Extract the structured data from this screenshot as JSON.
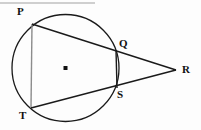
{
  "figure": {
    "background_color": "#fdfdfd",
    "stroke_color": "#1a1a1a",
    "chord_pt_color": "#8c8c8c",
    "header_rule_color": "#cfcfcf",
    "circle": {
      "center_x": 65.5,
      "center_y": 68,
      "radius": 53.5,
      "center_dot_label": "center-dot"
    },
    "header_rule": {
      "x1": 0,
      "y1": 3,
      "x2": 95,
      "y2": 3
    },
    "points": [
      {
        "id": "P",
        "label": "P",
        "x": 32,
        "y": 24,
        "label_x": 17,
        "label_y": 6,
        "on_circle": true
      },
      {
        "id": "Q",
        "label": "Q",
        "x": 116,
        "y": 50,
        "label_x": 119,
        "label_y": 38,
        "on_circle": true
      },
      {
        "id": "R",
        "label": "R",
        "x": 176,
        "y": 70,
        "label_x": 182,
        "label_y": 64,
        "on_circle": false
      },
      {
        "id": "S",
        "label": "S",
        "x": 117,
        "y": 88,
        "label_x": 117,
        "label_y": 89,
        "on_circle": true
      },
      {
        "id": "T",
        "label": "T",
        "x": 31,
        "y": 108,
        "label_x": 19,
        "label_y": 110,
        "on_circle": true
      }
    ],
    "segments": [
      {
        "id": "PR",
        "from": "P",
        "to": "R",
        "style": "dark",
        "name": "secant-p-q-r"
      },
      {
        "id": "TR",
        "from": "T",
        "to": "R",
        "style": "dark",
        "name": "secant-t-s-r"
      },
      {
        "id": "PT",
        "from": "P",
        "to": "T",
        "style": "light",
        "name": "chord-p-t"
      },
      {
        "id": "QS",
        "from": "Q",
        "to": "S",
        "style": "dark",
        "name": "chord-q-s"
      }
    ]
  }
}
